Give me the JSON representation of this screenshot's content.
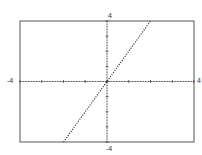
{
  "chart_data": {
    "type": "line",
    "title": "",
    "xlabel": "",
    "ylabel": "",
    "xlim": [
      -4,
      4
    ],
    "ylim": [
      -4,
      4
    ],
    "x_tick_step": 1,
    "y_tick_step": 1,
    "grid": false,
    "axis_labels": {
      "xmin": "-4",
      "xmax": "4",
      "ymin": "-4",
      "ymax": "4"
    },
    "series": [
      {
        "name": "y = 2x",
        "style": "dotted",
        "color": "#333333",
        "x": [
          -2,
          -1,
          0,
          1,
          2
        ],
        "y": [
          -4,
          -2,
          0,
          2,
          4
        ]
      }
    ]
  },
  "labels": {
    "xmin": "-4",
    "xmax": "4",
    "ymin": "-4",
    "ymax": "4"
  },
  "colors": {
    "frame": "#555555",
    "axis": "#444444",
    "line": "#333333"
  }
}
